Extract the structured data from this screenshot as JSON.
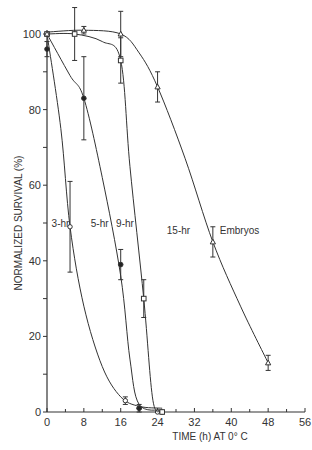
{
  "chart_data": {
    "type": "line",
    "title": "",
    "xlabel": "TIME (h) AT 0° C",
    "ylabel": "NORMALIZED SURVIVAL (%)",
    "xlim": [
      0,
      56
    ],
    "ylim": [
      0,
      100
    ],
    "xticks": [
      0,
      8,
      16,
      24,
      32,
      40,
      48,
      56
    ],
    "yticks": [
      0,
      20,
      40,
      60,
      80,
      100
    ],
    "grid": false,
    "legend": "inline curve labels",
    "series": [
      {
        "name": "3-hr",
        "marker": "open-circle",
        "points": [
          [
            0,
            100
          ],
          [
            5,
            49
          ],
          [
            17,
            3
          ],
          [
            20,
            1
          ],
          [
            24,
            0
          ]
        ],
        "errors": [
          0,
          12,
          1,
          0,
          0
        ],
        "curve": [
          [
            0,
            100
          ],
          [
            3,
            75
          ],
          [
            5,
            49
          ],
          [
            8,
            28
          ],
          [
            12,
            12
          ],
          [
            16,
            4
          ],
          [
            20,
            1.5
          ],
          [
            25,
            1
          ]
        ],
        "label_pos": [
          1,
          49
        ]
      },
      {
        "name": "5-hr",
        "marker": "filled-circle",
        "points": [
          [
            0,
            96
          ],
          [
            8,
            83
          ],
          [
            16,
            39
          ],
          [
            20,
            1
          ],
          [
            25,
            0
          ]
        ],
        "errors": [
          2,
          11,
          4,
          1,
          0
        ],
        "curve": [
          [
            0,
            100
          ],
          [
            5,
            89
          ],
          [
            8,
            83
          ],
          [
            12,
            62
          ],
          [
            16,
            36
          ],
          [
            18,
            14
          ],
          [
            20,
            2
          ],
          [
            25,
            0.5
          ]
        ],
        "label_pos": [
          9.5,
          49
        ]
      },
      {
        "name": "9-hr",
        "marker": "open-square",
        "points": [
          [
            0,
            100
          ],
          [
            6,
            100
          ],
          [
            16,
            93
          ],
          [
            21,
            30
          ],
          [
            25,
            0
          ]
        ],
        "errors": [
          0,
          7,
          6,
          5,
          0
        ],
        "curve": [
          [
            0,
            100
          ],
          [
            6,
            100
          ],
          [
            12,
            98
          ],
          [
            16,
            93
          ],
          [
            18,
            65
          ],
          [
            21,
            30
          ],
          [
            23,
            3
          ],
          [
            25,
            0.5
          ]
        ],
        "label_pos": [
          15,
          49
        ]
      },
      {
        "name": "15-hr Embryos",
        "marker": "open-triangle",
        "points": [
          [
            0,
            100
          ],
          [
            8,
            101
          ],
          [
            16,
            100
          ],
          [
            24,
            86
          ],
          [
            36,
            45
          ],
          [
            48,
            13
          ]
        ],
        "errors": [
          0,
          1,
          6,
          4,
          4,
          2
        ],
        "curve": [
          [
            0,
            100.5
          ],
          [
            8,
            101
          ],
          [
            16,
            100
          ],
          [
            20,
            95
          ],
          [
            24,
            86
          ],
          [
            30,
            67
          ],
          [
            36,
            45
          ],
          [
            42,
            28
          ],
          [
            48,
            13
          ]
        ],
        "label_pos": [
          26,
          47
        ]
      }
    ]
  }
}
